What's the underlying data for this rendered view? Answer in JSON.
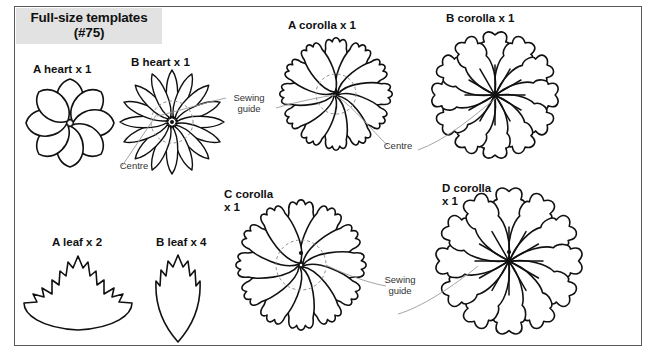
{
  "page": {
    "title_line1": "Full-size templates",
    "title_line2": "(#75)",
    "background": "#ffffff",
    "ink": "#111111",
    "title_bg": "#e2e2e2",
    "guide_color": "#8e8e8e"
  },
  "templates": [
    {
      "id": "a-heart",
      "label": "A heart x 1",
      "label_line1": "A heart x 1",
      "label_line2": "",
      "petals": 8,
      "style": "round-lobe"
    },
    {
      "id": "b-heart",
      "label": "B heart x 1",
      "label_line1": "B heart x 1",
      "label_line2": "",
      "petals": 16,
      "style": "narrow-point"
    },
    {
      "id": "a-corolla",
      "label": "A corolla x 1",
      "label_line1": "A corolla x 1",
      "label_line2": "",
      "petals": 12,
      "style": "scalloped"
    },
    {
      "id": "b-corolla",
      "label": "B corolla x 1",
      "label_line1": "B corolla x 1",
      "label_line2": "",
      "petals": 12,
      "style": "wavy"
    },
    {
      "id": "a-leaf",
      "label": "A leaf x 2",
      "label_line1": "A leaf x 2",
      "label_line2": "",
      "petals": 0,
      "style": "maple-leaf"
    },
    {
      "id": "b-leaf",
      "label": "B leaf x 4",
      "label_line1": "B leaf x 4",
      "label_line2": "",
      "petals": 0,
      "style": "narrow-leaf"
    },
    {
      "id": "c-corolla",
      "label": "C corolla x 1",
      "label_line1": "C corolla",
      "label_line2": "x 1",
      "petals": 12,
      "style": "scalloped"
    },
    {
      "id": "d-corolla",
      "label": "D corolla x 1",
      "label_line1": "D corolla",
      "label_line2": "x 1",
      "petals": 12,
      "style": "wavy"
    }
  ],
  "annotations": {
    "sewing_guide_line1": "Sewing",
    "sewing_guide_line2": "guide",
    "centre": "Centre"
  }
}
